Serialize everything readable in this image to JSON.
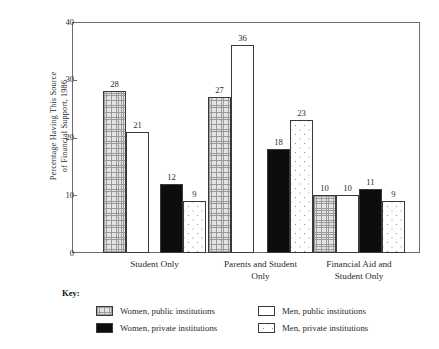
{
  "chart_data": {
    "type": "bar",
    "title": "",
    "subtitle": "",
    "xlabel": "",
    "ylabel": "Percentage Having This Source of Financial Support, 1986",
    "ylabel_lines": [
      "Percentage Having This Source",
      "of Financial Support, 1986"
    ],
    "ylim": [
      0,
      40
    ],
    "yticks": [
      0,
      10,
      20,
      30,
      40
    ],
    "ytick_labels": [
      "0",
      "10",
      "20",
      "30",
      "40"
    ],
    "grid": false,
    "legend_position": "below-plot",
    "legend_title": "Key:",
    "categories": [
      "Student Only",
      "Parents and Student Only",
      "Financial Aid and Student Only"
    ],
    "category_lines": [
      [
        "Student Only"
      ],
      [
        "Parents and Student",
        "Only"
      ],
      [
        "Financial Aid and",
        "Student Only"
      ]
    ],
    "series": [
      {
        "name": "Women, public institutions",
        "pattern": "checkered",
        "values": [
          28,
          27,
          10
        ]
      },
      {
        "name": "Men, public institutions",
        "pattern": "open",
        "values": [
          21,
          36,
          10
        ]
      },
      {
        "name": "Women, private institutions",
        "pattern": "solid-black",
        "values": [
          12,
          18,
          11
        ]
      },
      {
        "name": "Men, private institutions",
        "pattern": "speckled",
        "values": [
          9,
          23,
          9
        ]
      }
    ]
  },
  "legend": {
    "title": "Key:",
    "items": [
      {
        "label": "Women, public institutions",
        "pattern": "checkered"
      },
      {
        "label": "Women, private institutions",
        "pattern": "solid-black"
      },
      {
        "label": "Men, public institutions",
        "pattern": "open"
      },
      {
        "label": "Men, private institutions",
        "pattern": "speckled"
      }
    ]
  },
  "colors": {
    "axis": "#6d6d6d",
    "bar_outline": "#3a3a3a",
    "text": "#2b2b2b",
    "solid_fill": "#0d0d0d",
    "background": "#ffffff"
  }
}
